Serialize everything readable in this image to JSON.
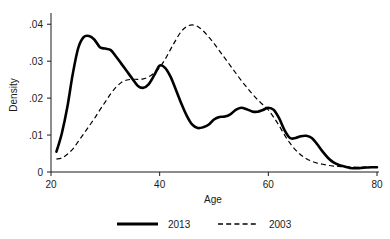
{
  "chart_data": {
    "type": "line",
    "title": "",
    "xlabel": "Age",
    "ylabel": "Density",
    "xlim": [
      20,
      80
    ],
    "ylim": [
      0,
      0.0425
    ],
    "grid": false,
    "legend_position": "bottom",
    "x_ticks": [
      "20",
      "40",
      "60",
      "80"
    ],
    "x_tick_values": [
      20,
      40,
      60,
      80
    ],
    "y_ticks": [
      ".04",
      ".03",
      ".02",
      ".01",
      "0"
    ],
    "y_tick_values": [
      0.04,
      0.03,
      0.02,
      0.01,
      0
    ],
    "series": [
      {
        "name": "2013",
        "style": "solid",
        "color": "#000000",
        "x": [
          21,
          22,
          23,
          24,
          25,
          26,
          27,
          28,
          29,
          30,
          31,
          32,
          33,
          34,
          35,
          36,
          37,
          38,
          39,
          40,
          41,
          42,
          43,
          44,
          45,
          46,
          47,
          48,
          49,
          50,
          51,
          52,
          53,
          54,
          55,
          56,
          57,
          58,
          59,
          60,
          61,
          62,
          63,
          64,
          65,
          66,
          67,
          68,
          69,
          70,
          71,
          72,
          73,
          74,
          75,
          76,
          77,
          78,
          79,
          80
        ],
        "values": [
          0.0055,
          0.0105,
          0.0175,
          0.0265,
          0.0335,
          0.0365,
          0.0368,
          0.0358,
          0.0338,
          0.0334,
          0.033,
          0.0312,
          0.0292,
          0.0272,
          0.0252,
          0.0233,
          0.0228,
          0.0238,
          0.0262,
          0.0288,
          0.0282,
          0.0258,
          0.0222,
          0.0185,
          0.0152,
          0.0128,
          0.0119,
          0.0121,
          0.0128,
          0.0142,
          0.0149,
          0.015,
          0.0156,
          0.0168,
          0.0174,
          0.017,
          0.0164,
          0.0163,
          0.0168,
          0.0174,
          0.0168,
          0.0145,
          0.0113,
          0.0092,
          0.0092,
          0.0097,
          0.0098,
          0.0092,
          0.0075,
          0.0055,
          0.0038,
          0.0026,
          0.0019,
          0.0015,
          0.0011,
          0.001,
          0.0011,
          0.0012,
          0.0013,
          0.0013
        ]
      },
      {
        "name": "2003",
        "style": "dashed",
        "color": "#000000",
        "x": [
          21,
          22,
          23,
          24,
          25,
          26,
          27,
          28,
          29,
          30,
          31,
          32,
          33,
          34,
          35,
          36,
          37,
          38,
          39,
          40,
          41,
          42,
          43,
          44,
          45,
          46,
          47,
          48,
          49,
          50,
          51,
          52,
          53,
          54,
          55,
          56,
          57,
          58,
          59,
          60,
          61,
          62,
          63,
          64,
          65,
          66,
          67,
          68,
          69,
          70,
          71,
          72,
          73,
          74,
          75,
          76,
          77,
          78,
          79,
          80
        ],
        "values": [
          0.0035,
          0.0038,
          0.0048,
          0.0062,
          0.0082,
          0.0103,
          0.0124,
          0.0145,
          0.0168,
          0.019,
          0.0212,
          0.023,
          0.0243,
          0.0249,
          0.0251,
          0.0251,
          0.0252,
          0.0258,
          0.0268,
          0.0283,
          0.0305,
          0.0332,
          0.0358,
          0.0381,
          0.0394,
          0.0398,
          0.0394,
          0.0382,
          0.0366,
          0.0348,
          0.0328,
          0.0308,
          0.0288,
          0.0268,
          0.0248,
          0.023,
          0.0212,
          0.0196,
          0.0182,
          0.0168,
          0.0148,
          0.0125,
          0.01,
          0.0078,
          0.006,
          0.0046,
          0.0036,
          0.0029,
          0.0024,
          0.0021,
          0.0018,
          0.0016,
          0.0015,
          0.0014,
          0.0014,
          0.0013,
          0.0013,
          0.0013,
          0.0013,
          0.0013
        ]
      }
    ]
  },
  "legend": {
    "items": [
      {
        "label": "2013"
      },
      {
        "label": "2003"
      }
    ]
  },
  "axes": {
    "x_title": "Age",
    "y_title": "Density"
  }
}
